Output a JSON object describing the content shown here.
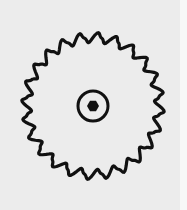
{
  "image": {
    "description": "Line drawing of a circular saw blade",
    "label": "saw-blade",
    "background_color": "#ececec",
    "stroke_color": "#111111"
  },
  "blade": {
    "center": [
      93,
      106
    ],
    "outer_radius": 70,
    "tooth_depth": 7,
    "teeth": 24,
    "stroke_width": 3.2
  },
  "hub": {
    "ring_radius": 15,
    "ring_stroke": 3,
    "bore_radius": 6,
    "bore_sides": 6
  }
}
